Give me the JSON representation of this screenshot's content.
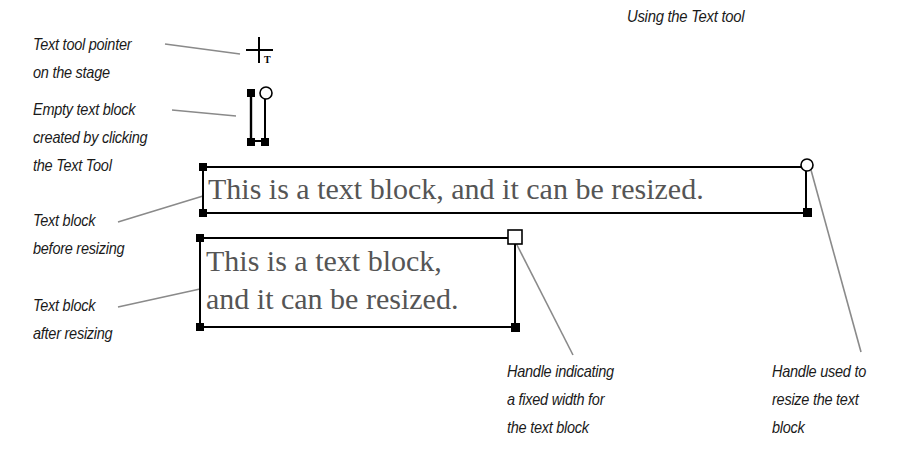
{
  "title": "Using the Text tool",
  "callouts": {
    "pointer": [
      "Text tool pointer",
      "on the stage"
    ],
    "empty_block": [
      "Empty text block",
      "created by clicking",
      "the Text Tool"
    ],
    "before": [
      "Text block",
      "before resizing"
    ],
    "after": [
      "Text block",
      "after resizing"
    ],
    "fixed_handle": [
      "Handle indicating",
      "a fixed width for",
      "the text block"
    ],
    "resize_handle": [
      "Handle used to",
      "resize the text",
      "block"
    ]
  },
  "text_blocks": {
    "before_resizing": "This is a text block, and it can be resized.",
    "after_resizing_lines": [
      "This is a text block,",
      "and it can be resized."
    ]
  },
  "icons": {
    "pointer": "text-tool-crosshair-icon",
    "resize_handle": "circle-handle-icon",
    "fixed_width_handle": "square-handle-icon"
  },
  "colors": {
    "leader_line": "#8a8a8a",
    "text_block_text": "#555555",
    "handle": "#000000",
    "label": "#1a1a1a"
  }
}
